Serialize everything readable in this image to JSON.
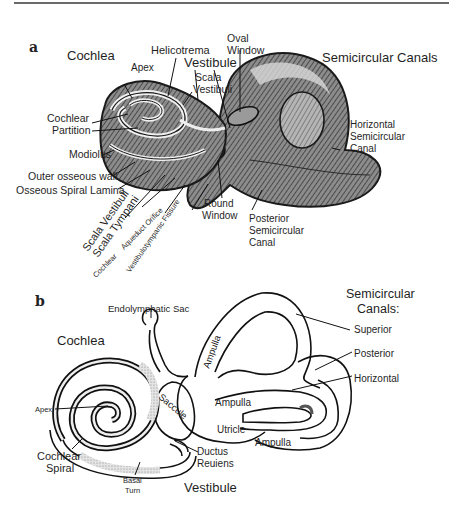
{
  "panel_a": {
    "letter": "a",
    "region_labels": {
      "cochlea": "Cochlea",
      "semicircular_canals": "Semicircular Canals",
      "vestibule": "Vestibule"
    },
    "labels": {
      "helicotrema": "Helicotrema",
      "apex": "Apex",
      "oval_window_1": "Oval",
      "oval_window_2": "Window",
      "scala_vestibuli_1": "Scala",
      "scala_vestibuli_2": "Vestibuli",
      "cochlear_partition_1": "Cochlear",
      "cochlear_partition_2": "Partition",
      "modiolus": "Modiolus",
      "outer_osseous_wall": "Outer osseous wall",
      "osseous_spiral_lamina": "Osseous Spiral Lamina",
      "scala_vestibuli_rot": "Scala Vestibuli",
      "scala_tympani_rot": "Scala Tympani",
      "cochlear_rot": "Cochlear",
      "aqueduct_orifice_rot": "Aqueduct Orifice",
      "vestibulotympanic_fissure_rot": "Vestibulotympanic Fissure",
      "round_window_1": "Round",
      "round_window_2": "Window",
      "horizontal_sc_1": "Horizontal",
      "horizontal_sc_2": "Semicircular",
      "horizontal_sc_3": "Canal",
      "posterior_sc_1": "Posterior",
      "posterior_sc_2": "Semicircular",
      "posterior_sc_3": "Canal"
    }
  },
  "panel_b": {
    "letter": "b",
    "region_labels": {
      "cochlea": "Cochlea",
      "semicircular_canals_1": "Semicircular",
      "semicircular_canals_2": "Canals:",
      "vestibule": "Vestibule"
    },
    "labels": {
      "endolymphatic_sac": "Endolymphatic Sac",
      "superior": "Superior",
      "posterior": "Posterior",
      "horizontal": "Horizontal",
      "ampulla_superior": "Ampulla",
      "ampulla_horizontal": "Ampulla",
      "ampulla_posterior": "Ampulla",
      "saccule": "Saccule",
      "utricle": "Utricle",
      "apex": "Apex",
      "cochlear_spiral_1": "Cochlear",
      "cochlear_spiral_2": "Spiral",
      "basal_turn_1": "Basal",
      "basal_turn_2": "Turn",
      "ductus_reuniens_1": "Ductus",
      "ductus_reuniens_2": "Reuiens"
    }
  }
}
